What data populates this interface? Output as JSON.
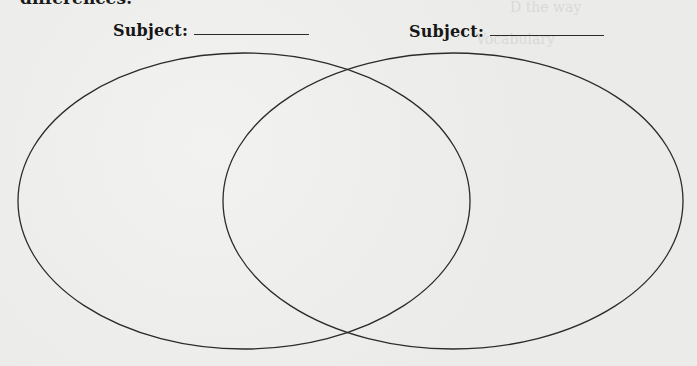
{
  "page": {
    "top_cut_text": "differences:",
    "bleed_through_lines": [
      "D the way",
      "Vocabulary",
      "15. Which sentence is ... ?",
      "A. There were two roads diverging in a wood, the most traveled one",
      "B. The poet did not understand their greatest choice could change the",
      "C. The crowd was unaware he dropped into the ...",
      "D. When it started to snap the ... the ...",
      "16. Which word is most nearly ... meaning as ... ?",
      "A. the ...",
      "B. ...",
      "C. withdrawal",
      "D. ...",
      "17. In which sentences ... used correctly?",
      "A. He enjoyed the visiting ... strolled ... improvising",
      "B. The ... people ... with ... through ... way",
      "C. The ... were pleased ... own ...",
      "D. ... "
    ]
  },
  "venn": {
    "left_subject": {
      "label": "Subject:",
      "value": ""
    },
    "right_subject": {
      "label": "Subject:",
      "value": ""
    },
    "circles": [
      {
        "name": "left",
        "cx": 244,
        "cy": 201,
        "rx": 226,
        "ry": 148
      },
      {
        "name": "right",
        "cx": 453,
        "cy": 201,
        "rx": 230,
        "ry": 148
      }
    ],
    "stroke_color": "#2b2b2b"
  }
}
